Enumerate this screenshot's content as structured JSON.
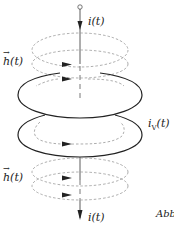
{
  "diagram": {
    "labels": {
      "current_top": "i(t)",
      "current_bottom": "i(t)",
      "field_top_symbol": "h",
      "field_top_arg": "(t)",
      "field_bottom_symbol": "h",
      "field_bottom_arg": "(t)",
      "induced_current": "i",
      "induced_current_sub": "V",
      "induced_current_arg": "(t)",
      "caption_fragment": "Abb"
    },
    "colors": {
      "stroke": "#222222",
      "dashed": "#8a8a8a",
      "background": "#ffffff"
    },
    "elements": {
      "conductor": "vertical wire carrying current i(t)",
      "field_loops_top": 2,
      "field_loops_bottom": 2,
      "solid_rings": 2
    }
  }
}
